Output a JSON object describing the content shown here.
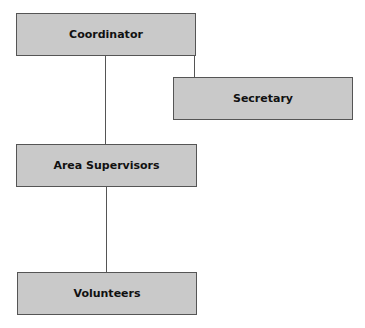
{
  "diagram": {
    "type": "org-chart",
    "nodes": [
      {
        "id": "coordinator",
        "label": "Coordinator"
      },
      {
        "id": "secretary",
        "label": "Secretary"
      },
      {
        "id": "area_supervisors",
        "label": "Area Supervisors"
      },
      {
        "id": "volunteers",
        "label": "Volunteers"
      }
    ],
    "edges": [
      {
        "from": "coordinator",
        "to": "secretary"
      },
      {
        "from": "coordinator",
        "to": "area_supervisors"
      },
      {
        "from": "area_supervisors",
        "to": "volunteers"
      }
    ],
    "colors": {
      "box_fill": "#c9c9c9",
      "box_border": "#555555",
      "line": "#555555",
      "text": "#111111"
    }
  }
}
